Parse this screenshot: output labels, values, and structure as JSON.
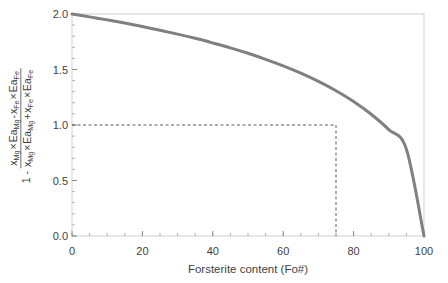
{
  "chart_data": {
    "type": "line",
    "title": "",
    "xlabel": "Forsterite content (Fo#)",
    "ylabel_parts": {
      "lead": "1 -",
      "numerator": "x_Mg × Ea_Mg - x_Fe × Ea_Fe",
      "denominator": "x_Mg × Ea_Mg + x_Fe × Ea_Fe",
      "num_tokens": [
        {
          "base": "x",
          "sub": "Mg"
        },
        {
          "op": "×"
        },
        {
          "base": "Ea",
          "sub": "Mg"
        },
        {
          "op": "-"
        },
        {
          "base": "x",
          "sub": "Fe"
        },
        {
          "op": "×"
        },
        {
          "base": "Ea",
          "sub": "Fe"
        }
      ],
      "den_tokens": [
        {
          "base": "x",
          "sub": "Mg"
        },
        {
          "op": "×"
        },
        {
          "base": "Ea",
          "sub": "Mg"
        },
        {
          "op": "+"
        },
        {
          "base": "x",
          "sub": "Fe"
        },
        {
          "op": "×"
        },
        {
          "base": "Ea",
          "sub": "Fe"
        }
      ]
    },
    "xlim": [
      0,
      100
    ],
    "ylim": [
      0,
      2.0
    ],
    "xticks": [
      0,
      20,
      40,
      60,
      80,
      100
    ],
    "xtick_labels": [
      "0",
      "20",
      "40",
      "60",
      "80",
      "100"
    ],
    "yticks": [
      0.0,
      0.5,
      1.0,
      1.5,
      2.0
    ],
    "ytick_labels": [
      "0.0",
      "0.5",
      "1.0",
      "1.5",
      "2.0"
    ],
    "x_minor_tick_interval": 5,
    "y_minor_tick_interval": 0.1,
    "grid": false,
    "legend": null,
    "series": [
      {
        "name": "normalized activation-energy contrast",
        "color": "#808080",
        "line_width": 3,
        "x": [
          0,
          5,
          10,
          15,
          20,
          25,
          30,
          35,
          40,
          45,
          50,
          55,
          60,
          65,
          70,
          75,
          80,
          85,
          90,
          95,
          100
        ],
        "values": [
          2.0,
          1.974,
          1.947,
          1.918,
          1.887,
          1.854,
          1.819,
          1.781,
          1.739,
          1.695,
          1.646,
          1.592,
          1.533,
          1.467,
          1.393,
          1.309,
          1.212,
          1.097,
          0.958,
          0.782,
          0.0
        ]
      }
    ],
    "annotations": [
      {
        "name": "reference-lines",
        "type": "dashed-crosshair",
        "x": 75,
        "y": 1.0,
        "color": "#5a5a5a",
        "description": "horizontal dashed line at y = 1.0 meeting vertical dashed line at Fo# ≈ 75"
      }
    ],
    "frame_color": "#cfcfcf",
    "axis_color": "#a0a0a0",
    "background": "#ffffff"
  }
}
